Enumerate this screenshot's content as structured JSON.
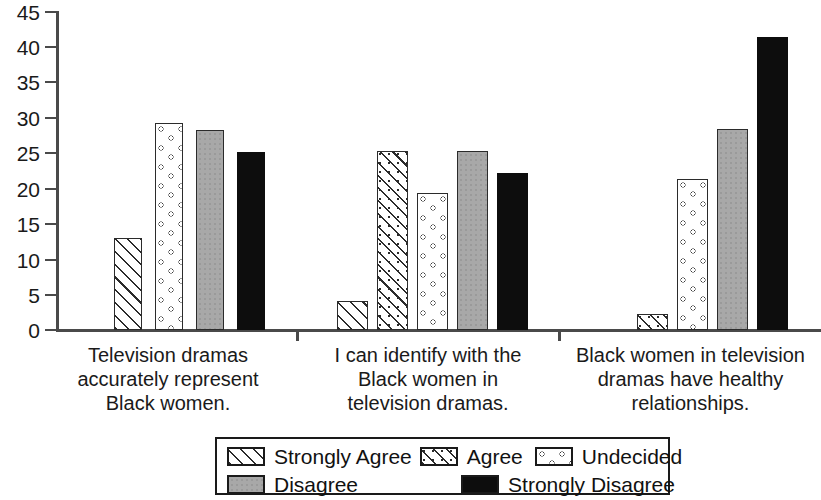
{
  "chart_data": {
    "type": "bar",
    "title": "",
    "subtitle": "",
    "xlabel": "",
    "ylabel": "",
    "ylim": [
      0,
      45
    ],
    "ytick_step": 5,
    "yticks": [
      "0",
      "5",
      "10",
      "15",
      "20",
      "25",
      "30",
      "35",
      "40",
      "45"
    ],
    "grid": false,
    "legend_position": "bottom",
    "categories": [
      "Television dramas accurately represent Black women.",
      "I can identify with the Black women in television dramas.",
      "Black women in television dramas have healthy relationships."
    ],
    "category_lines": [
      [
        "Television dramas",
        "accurately represent",
        "Black women."
      ],
      [
        "I can identify with the",
        "Black women in",
        "television dramas."
      ],
      [
        "Black women in television",
        "dramas have healthy",
        "relationships."
      ]
    ],
    "series": [
      {
        "name": "Strongly Agree",
        "pattern": "diagonal-hatch",
        "values": [
          13.0,
          4.1,
          0.0
        ]
      },
      {
        "name": "Agree",
        "pattern": "dotted-diagonal-hatch",
        "values": [
          0.0,
          25.2,
          2.2
        ]
      },
      {
        "name": "Undecided",
        "pattern": "open-circles",
        "values": [
          29.2,
          19.3,
          21.3
        ]
      },
      {
        "name": "Disagree",
        "pattern": "solid-gray",
        "values": [
          28.2,
          25.3,
          28.4
        ]
      },
      {
        "name": "Strongly Disagree",
        "pattern": "solid-black",
        "values": [
          25.1,
          22.2,
          41.3
        ]
      }
    ]
  },
  "legend": {
    "row1": [
      "Strongly Agree",
      "Agree",
      "Undecided"
    ],
    "row2": [
      "Disagree",
      "Strongly Disagree"
    ]
  },
  "colors": {
    "axis": "#4a4a4a",
    "text": "#1a1a1a",
    "disagree_gray": "#a8a8a8",
    "strongly_disagree_black": "#0d0d0d"
  }
}
